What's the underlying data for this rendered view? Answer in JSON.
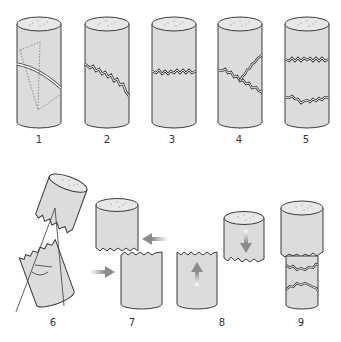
{
  "figure": {
    "colors": {
      "body": "#dcdcdc",
      "top": "#e8e8e8",
      "outline": "#3a3a3a",
      "arrow": "#8c8c8c",
      "label": "#333333"
    },
    "panels": [
      {
        "label": "1",
        "desc": "helical shear plane with dotted triangle"
      },
      {
        "label": "2",
        "desc": "inclined jagged fracture"
      },
      {
        "label": "3",
        "desc": "horizontal jagged fracture"
      },
      {
        "label": "4",
        "desc": "branching fracture"
      },
      {
        "label": "5",
        "desc": "two horizontal fractures"
      },
      {
        "label": "6",
        "desc": "split pieces with fracture angle"
      },
      {
        "label": "7",
        "desc": "pieces moved together with arrows"
      },
      {
        "label": "8",
        "desc": "pieces aligned with vertical arrows"
      },
      {
        "label": "9",
        "desc": "reassembled specimen"
      }
    ]
  }
}
